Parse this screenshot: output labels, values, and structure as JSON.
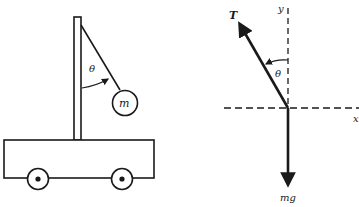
{
  "diagram": {
    "left_panel": {
      "description": "Pendulum hanging from pole on cart",
      "labels": {
        "angle": "θ",
        "mass": "m"
      }
    },
    "right_panel": {
      "description": "Free-body diagram of pendulum bob",
      "labels": {
        "tension": "T",
        "angle": "θ",
        "y_axis": "y",
        "x_axis": "x",
        "weight": "mg"
      }
    },
    "colors": {
      "ink": "#1a1a1a",
      "background": "#ffffff"
    }
  }
}
